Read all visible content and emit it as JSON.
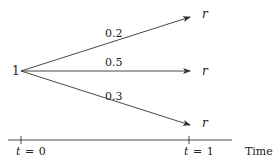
{
  "diagram": {
    "type": "probability-tree",
    "root": {
      "label": "1"
    },
    "branches": [
      {
        "probability": "0.2",
        "outcome": "r"
      },
      {
        "probability": "0.5",
        "outcome": "r"
      },
      {
        "probability": "0.3",
        "outcome": "r"
      }
    ],
    "time_axis": {
      "ticks": [
        {
          "var": "t",
          "eq": "=",
          "val": "0"
        },
        {
          "var": "t",
          "eq": "=",
          "val": "1"
        }
      ],
      "label": "Time"
    },
    "colors": {
      "line": "#333333",
      "text": "#222222",
      "background": "#ffffff"
    }
  }
}
